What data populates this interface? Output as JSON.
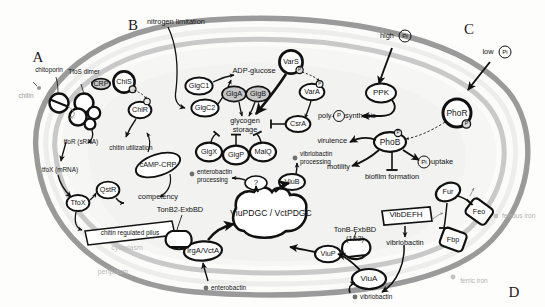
{
  "figure": {
    "organism_cell": "bacterial cell schematic",
    "membrane_labels": {
      "cytoplasm": "cytoplasm",
      "periplasm": "periplasm"
    }
  },
  "panels": [
    {
      "id": "A",
      "letter": "A",
      "topic": "chitin sensing and natural competence"
    },
    {
      "id": "B",
      "letter": "B",
      "topic": "glycogen metabolism"
    },
    {
      "id": "C",
      "letter": "C",
      "topic": "phosphate sensing"
    },
    {
      "id": "D",
      "letter": "D",
      "topic": "iron and siderophore uptake"
    }
  ],
  "panelA": {
    "substrate": "chitin",
    "porin": "chitoporin",
    "sensor_dimer": "TfoS dimer",
    "crp": "CRP",
    "chis": "ChiS",
    "chir": "ChiR",
    "srna": "tfoR (sRNA)",
    "mrna": "tfoX (mRNA)",
    "chitin_utilization": "chitin utilization",
    "camp_crp": "cAMP-CRP",
    "tfox": "TfoX",
    "qstr": "QstR",
    "competency": "competency",
    "pilus": "chitin regulated pilus"
  },
  "panelB": {
    "stimulus": "nitrogen limitation",
    "glgc1": "GlgC1",
    "glgc2": "GlgC2",
    "adp_glucose": "ADP-glucose",
    "glga": "GlgA",
    "glgb": "GlgB",
    "glycogen_storage": "glycogen\nstorage",
    "glycogen_storage_line1": "glycogen",
    "glycogen_storage_line2": "storage",
    "glgx": "GlgX",
    "glgp": "GlgP",
    "malq": "MalQ",
    "vars": "VarS",
    "vara": "VarA",
    "csra": "CsrA",
    "phospho_mark": "P"
  },
  "panelC": {
    "high_pi": "high",
    "high_pi_symbol": "Pi",
    "low_pi": "low",
    "low_pi_symbol": "Pi",
    "ppk": "PPK",
    "poly_p_synthesis_pre": "poly-",
    "poly_p_symbol": "P",
    "poly_p_synthesis_post": "synthesis",
    "phor": "PhoR",
    "phob": "PhoB",
    "virulence": "virulence",
    "motility": "motility",
    "biofilm": "biofilm formation",
    "pi_uptake_symbol": "Pi",
    "pi_uptake": "uptake",
    "phospho_mark": "P"
  },
  "panelD": {
    "tonb2_exbbd": "TonB2-ExbBD",
    "irga_vcta": "IrgA/VctA",
    "enterobactin": "enterobactin",
    "enterobactin_processing_l1": "enterobactin",
    "enterobactin_processing_l2": "processing",
    "unknown": "?",
    "viupdgc": "ViuPDGC / VctPDGC",
    "viub": "ViuB",
    "vibriobactin_processing_l1": "vibriobactin",
    "vibriobactin_processing_l2": "processing",
    "viup": "ViuP",
    "viua": "ViuA",
    "tonb_exbbd_l1": "TonB-ExbBD",
    "tonb_exbbd_l2": "(1&2)",
    "vibdefh": "VibDEFH",
    "vibriobactin": "vibriobactin",
    "vibriobactin_external": "vibriobactin",
    "fur": "Fur",
    "feo": "Feo",
    "fbp": "Fbp",
    "ferrous_iron": "ferrous iron",
    "ferric_iron": "ferric iron"
  },
  "colors": {
    "outer_membrane": "#9a9a9a",
    "inner_membrane": "#c9c9c9",
    "cell_fill": "#fbfbfa",
    "cytoplasm_fill": "#f4f4f3",
    "node_stroke": "#111111",
    "shaded_node": "#c6c6c6",
    "text": "#111111",
    "faint_text": "#b9b9b9"
  }
}
